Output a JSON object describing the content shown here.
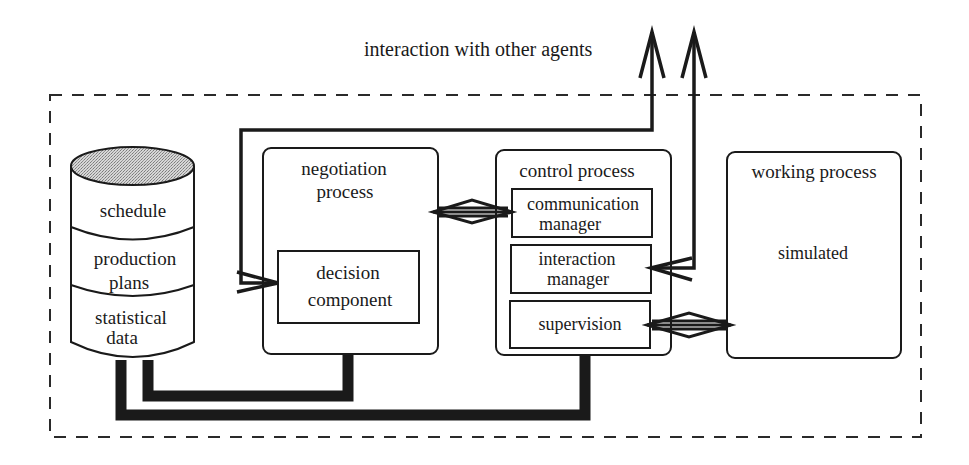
{
  "diagram": {
    "external_label": "interaction with other agents",
    "database": {
      "sections": [
        {
          "label": "schedule"
        },
        {
          "label_line1": "production",
          "label_line2": "plans"
        },
        {
          "label_line1": "statistical",
          "label_line2": "data"
        }
      ]
    },
    "negotiation": {
      "title_line1": "negotiation",
      "title_line2": "process",
      "decision": {
        "line1": "decision",
        "line2": "component"
      }
    },
    "control": {
      "title": "control process",
      "communication": {
        "line1": "communication",
        "line2": "manager"
      },
      "interaction": {
        "line1": "interaction",
        "line2": "manager"
      },
      "supervision": {
        "label": "supervision"
      }
    },
    "working": {
      "title": "working process",
      "body": "simulated"
    },
    "colors": {
      "ink": "#1a1a1a",
      "db_top_fill": "#bdbdbd",
      "background": "#ffffff"
    }
  }
}
